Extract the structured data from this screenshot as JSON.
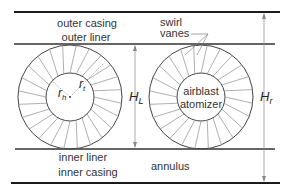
{
  "diagram": {
    "labels": {
      "outer_casing": "outer casing",
      "outer_liner": "outer liner",
      "inner_liner": "inner liner",
      "inner_casing": "inner casing",
      "annulus": "annulus",
      "swirl_vanes_line1": "swirl",
      "swirl_vanes_line2": "vanes",
      "airblast_line1": "airblast",
      "airblast_line2": "atomizer",
      "r_h": "r",
      "r_h_sub": "h",
      "r_t": "r",
      "r_t_sub": "t",
      "H_L": "H",
      "H_L_sub": "L",
      "H_r": "H",
      "H_r_sub": "r"
    },
    "colors": {
      "casing_line": "#1a1a1a",
      "liner_line": "#333333",
      "circle_line": "#444444",
      "vane_line": "#9a9a9a",
      "dimension_line": "#888888"
    },
    "geometry": {
      "left_atomizer_center": [
        70,
        97
      ],
      "right_atomizer_center": [
        201,
        97
      ],
      "outer_radius": 52,
      "inner_radius": 24,
      "vane_count": 24
    }
  }
}
